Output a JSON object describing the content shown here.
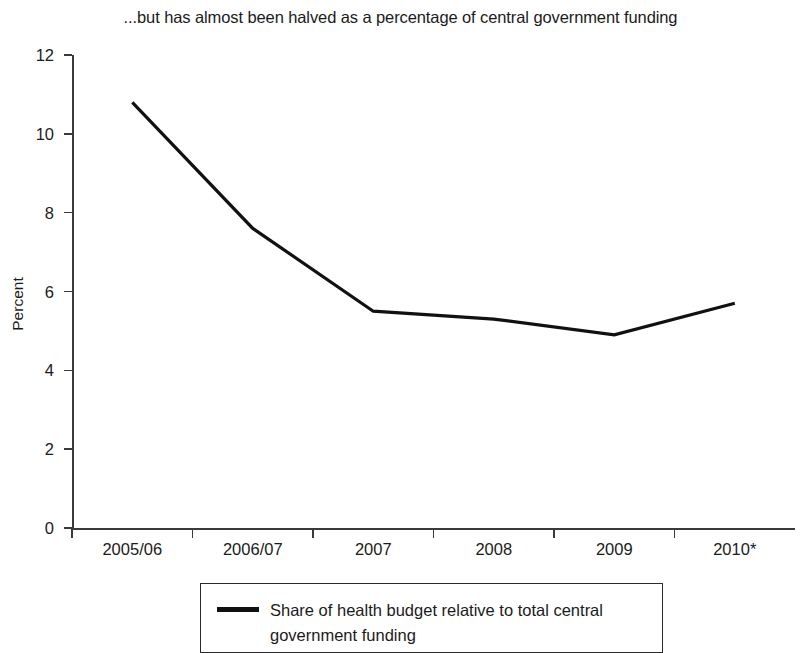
{
  "chart_data": {
    "type": "line",
    "title": "...but has almost been halved as a percentage of central government funding",
    "xlabel": "",
    "ylabel": "Percent",
    "categories": [
      "2005/06",
      "2006/07",
      "2007",
      "2008",
      "2009",
      "2010*"
    ],
    "series": [
      {
        "name": "Share of health budget relative to total central government funding",
        "values": [
          10.8,
          7.6,
          5.5,
          5.3,
          4.9,
          5.7
        ],
        "color": "#111111"
      }
    ],
    "ylim": [
      0,
      12
    ],
    "yticks": [
      0,
      2,
      4,
      6,
      8,
      10,
      12
    ],
    "ytick_labels": [
      "0",
      "2",
      "4",
      "6",
      "8",
      "10",
      "12"
    ],
    "grid": false,
    "legend_position": "bottom"
  },
  "legend": {
    "entries": [
      {
        "label": "Share of health budget relative to total central government funding",
        "swatch": "line-swatch"
      }
    ]
  }
}
